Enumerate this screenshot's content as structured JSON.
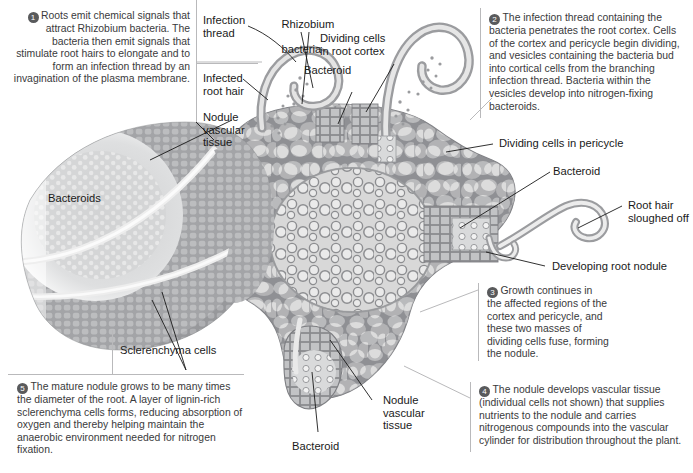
{
  "figure": {
    "colors": {
      "cell_wall": "#8f9094",
      "cell_lumen": "#dcdcdc",
      "nodule_tissue": "#9b9c9f",
      "bacteroid_zone": "#c9cacb",
      "vascular_light": "#e8e8e8",
      "leader_line": "#1a1a1a",
      "rule": "#b9b9bb",
      "badge_bg": "#595a5c",
      "badge_text": "#ffffff",
      "body_text": "#3a3a3c",
      "label_text": "#1a1a1a"
    }
  },
  "steps": [
    {
      "number": "1",
      "text": "Roots emit chemical signals that attract Rhizobium bacteria. The bacteria then emit signals that stimulate root hairs to elongate and to form an infection thread by an invagination of the plasma membrane.",
      "align": "right"
    },
    {
      "number": "2",
      "text": "The infection thread containing the bacteria penetrates the root cortex. Cells of the cortex and pericycle begin dividing, and vesicles containing the bacteria bud into cortical cells from the branching infection thread. Bacteria within the vesicles develop into nitrogen-fixing bacteroids.",
      "align": "left"
    },
    {
      "number": "3",
      "text": "Growth continues in the affected regions of the cortex and pericycle, and these two masses of dividing cells fuse, forming the nodule.",
      "align": "left"
    },
    {
      "number": "4",
      "text": "The nodule develops vascular tissue (individual cells not shown) that supplies nutrients to the nodule and carries nitrogenous compounds into the vascular cylinder for distribution throughout the plant.",
      "align": "left"
    },
    {
      "number": "5",
      "text": "The mature nodule grows to be many times the diameter of the root. A layer of lignin-rich sclerenchyma cells forms, reducing absorption of oxygen and thereby helping maintain the anaerobic environment needed for nitrogen fixation.",
      "align": "left"
    }
  ],
  "labels": {
    "infection_thread": "Infection\nthread",
    "rhizobium_bacteria_italic": "Rhizobium",
    "rhizobium_bacteria_rest": "bacteria",
    "infected_root_hair": "Infected\nroot hair",
    "nodule_vascular_tissue_left": "Nodule\nvascular\ntissue",
    "dividing_cells_root_cortex": "Dividing cells\nin root cortex",
    "bacteroid_top": "Bacteroid",
    "dividing_cells_pericycle": "Dividing cells in pericycle",
    "bacteroid_right": "Bacteroid",
    "root_hair_sloughed_off": "Root hair\nsloughed off",
    "developing_root_nodule": "Developing root nodule",
    "bacteroids_left": "Bacteroids",
    "sclerenchyma_cells": "Sclerenchyma cells",
    "nodule_vascular_tissue_bottom": "Nodule\nvascular\ntissue",
    "bacteroid_bottom": "Bacteroid"
  }
}
